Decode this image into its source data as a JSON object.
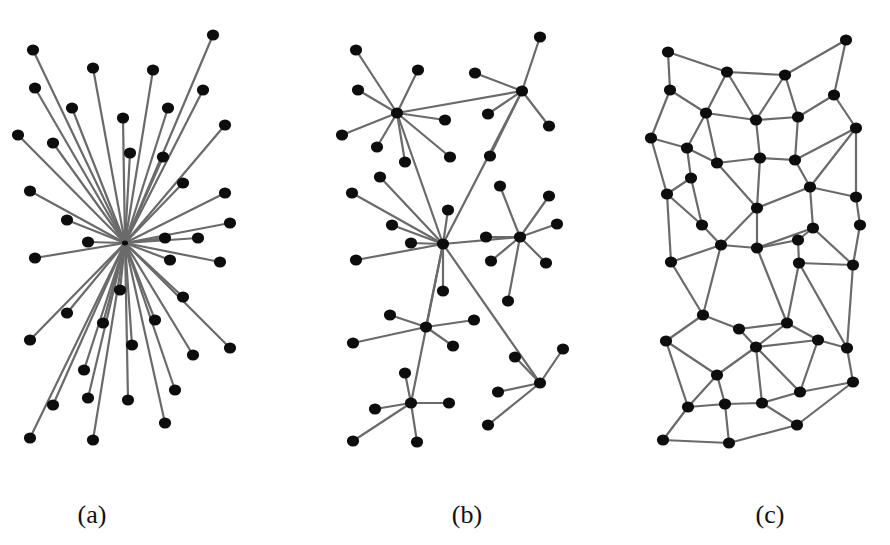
{
  "figure": {
    "panels": [
      {
        "label": "(a)",
        "label_x": 92,
        "type": "centralized",
        "hub": [
          125,
          243
        ],
        "nodes": [
          [
            33,
            50
          ],
          [
            213,
            35
          ],
          [
            93,
            68
          ],
          [
            153,
            70
          ],
          [
            35,
            88
          ],
          [
            203,
            90
          ],
          [
            72,
            108
          ],
          [
            123,
            118
          ],
          [
            168,
            108
          ],
          [
            18,
            135
          ],
          [
            225,
            125
          ],
          [
            53,
            143
          ],
          [
            130,
            153
          ],
          [
            163,
            157
          ],
          [
            183,
            183
          ],
          [
            30,
            191
          ],
          [
            225,
            193
          ],
          [
            67,
            220
          ],
          [
            230,
            223
          ],
          [
            88,
            242
          ],
          [
            165,
            238
          ],
          [
            198,
            238
          ],
          [
            35,
            258
          ],
          [
            170,
            260
          ],
          [
            220,
            262
          ],
          [
            120,
            290
          ],
          [
            183,
            297
          ],
          [
            67,
            313
          ],
          [
            103,
            323
          ],
          [
            155,
            320
          ],
          [
            230,
            348
          ],
          [
            193,
            355
          ],
          [
            30,
            340
          ],
          [
            132,
            345
          ],
          [
            84,
            370
          ],
          [
            175,
            390
          ],
          [
            53,
            405
          ],
          [
            88,
            398
          ],
          [
            128,
            400
          ],
          [
            165,
            423
          ],
          [
            30,
            438
          ],
          [
            93,
            440
          ]
        ]
      },
      {
        "label": "(b)",
        "label_x": 467,
        "type": "decentralized",
        "nodes": [
          [
            443,
            244
          ],
          [
            397,
            113
          ],
          [
            522,
            91
          ],
          [
            520,
            237
          ],
          [
            540,
            383
          ],
          [
            411,
            403
          ],
          [
            426,
            327
          ],
          [
            356,
            50
          ],
          [
            418,
            70
          ],
          [
            358,
            90
          ],
          [
            475,
            73
          ],
          [
            540,
            37
          ],
          [
            342,
            135
          ],
          [
            377,
            147
          ],
          [
            445,
            120
          ],
          [
            450,
            157
          ],
          [
            405,
            162
          ],
          [
            490,
            156
          ],
          [
            549,
            126
          ],
          [
            488,
            114
          ],
          [
            380,
            177
          ],
          [
            352,
            193
          ],
          [
            448,
            210
          ],
          [
            392,
            225
          ],
          [
            411,
            243
          ],
          [
            356,
            260
          ],
          [
            443,
            291
          ],
          [
            500,
            186
          ],
          [
            549,
            196
          ],
          [
            557,
            224
          ],
          [
            486,
            237
          ],
          [
            491,
            261
          ],
          [
            546,
            263
          ],
          [
            508,
            301
          ],
          [
            390,
            315
          ],
          [
            474,
            320
          ],
          [
            353,
            343
          ],
          [
            453,
            346
          ],
          [
            515,
            357
          ],
          [
            563,
            349
          ],
          [
            498,
            392
          ],
          [
            488,
            425
          ],
          [
            405,
            373
          ],
          [
            449,
            403
          ],
          [
            375,
            409
          ],
          [
            353,
            441
          ],
          [
            417,
            442
          ]
        ],
        "edges": [
          [
            0,
            1
          ],
          [
            0,
            2
          ],
          [
            0,
            3
          ],
          [
            0,
            4
          ],
          [
            0,
            5
          ],
          [
            0,
            6
          ],
          [
            1,
            2
          ],
          [
            1,
            7
          ],
          [
            1,
            8
          ],
          [
            1,
            9
          ],
          [
            1,
            12
          ],
          [
            1,
            13
          ],
          [
            1,
            14
          ],
          [
            1,
            15
          ],
          [
            1,
            16
          ],
          [
            2,
            10
          ],
          [
            2,
            11
          ],
          [
            2,
            18
          ],
          [
            2,
            17
          ],
          [
            2,
            19
          ],
          [
            0,
            20
          ],
          [
            0,
            21
          ],
          [
            0,
            22
          ],
          [
            0,
            23
          ],
          [
            0,
            24
          ],
          [
            0,
            25
          ],
          [
            0,
            26
          ],
          [
            3,
            27
          ],
          [
            3,
            28
          ],
          [
            3,
            29
          ],
          [
            3,
            30
          ],
          [
            3,
            31
          ],
          [
            3,
            32
          ],
          [
            3,
            33
          ],
          [
            6,
            34
          ],
          [
            6,
            35
          ],
          [
            6,
            36
          ],
          [
            6,
            37
          ],
          [
            4,
            38
          ],
          [
            4,
            39
          ],
          [
            4,
            40
          ],
          [
            4,
            41
          ],
          [
            5,
            42
          ],
          [
            5,
            43
          ],
          [
            5,
            44
          ],
          [
            5,
            45
          ],
          [
            5,
            46
          ]
        ]
      },
      {
        "label": "(c)",
        "label_x": 770,
        "type": "distributed",
        "nodes": [
          [
            668,
            52
          ],
          [
            727,
            72
          ],
          [
            785,
            75
          ],
          [
            846,
            40
          ],
          [
            670,
            90
          ],
          [
            706,
            113
          ],
          [
            756,
            120
          ],
          [
            798,
            117
          ],
          [
            834,
            95
          ],
          [
            651,
            138
          ],
          [
            687,
            148
          ],
          [
            717,
            163
          ],
          [
            760,
            158
          ],
          [
            795,
            160
          ],
          [
            856,
            128
          ],
          [
            691,
            178
          ],
          [
            667,
            194
          ],
          [
            810,
            187
          ],
          [
            757,
            208
          ],
          [
            856,
            197
          ],
          [
            702,
            225
          ],
          [
            813,
            228
          ],
          [
            757,
            248
          ],
          [
            798,
            240
          ],
          [
            860,
            225
          ],
          [
            671,
            262
          ],
          [
            721,
            245
          ],
          [
            799,
            263
          ],
          [
            853,
            265
          ],
          [
            703,
            315
          ],
          [
            739,
            329
          ],
          [
            787,
            323
          ],
          [
            847,
            348
          ],
          [
            666,
            341
          ],
          [
            756,
            347
          ],
          [
            818,
            340
          ],
          [
            853,
            382
          ],
          [
            717,
            375
          ],
          [
            800,
            392
          ],
          [
            688,
            407
          ],
          [
            725,
            404
          ],
          [
            762,
            403
          ],
          [
            663,
            440
          ],
          [
            729,
            443
          ],
          [
            797,
            425
          ]
        ],
        "edges": [
          [
            0,
            1
          ],
          [
            1,
            2
          ],
          [
            2,
            3
          ],
          [
            0,
            4
          ],
          [
            3,
            8
          ],
          [
            1,
            5
          ],
          [
            1,
            6
          ],
          [
            2,
            6
          ],
          [
            2,
            7
          ],
          [
            4,
            5
          ],
          [
            7,
            8
          ],
          [
            8,
            14
          ],
          [
            5,
            6
          ],
          [
            6,
            7
          ],
          [
            4,
            9
          ],
          [
            9,
            10
          ],
          [
            10,
            11
          ],
          [
            5,
            10
          ],
          [
            5,
            11
          ],
          [
            6,
            12
          ],
          [
            7,
            13
          ],
          [
            11,
            12
          ],
          [
            12,
            13
          ],
          [
            13,
            14
          ],
          [
            9,
            16
          ],
          [
            10,
            15
          ],
          [
            15,
            16
          ],
          [
            11,
            18
          ],
          [
            12,
            18
          ],
          [
            13,
            17
          ],
          [
            14,
            17
          ],
          [
            14,
            19
          ],
          [
            17,
            18
          ],
          [
            17,
            21
          ],
          [
            17,
            19
          ],
          [
            19,
            24
          ],
          [
            16,
            20
          ],
          [
            15,
            20
          ],
          [
            16,
            25
          ],
          [
            18,
            22
          ],
          [
            18,
            26
          ],
          [
            20,
            26
          ],
          [
            21,
            22
          ],
          [
            21,
            23
          ],
          [
            21,
            28
          ],
          [
            24,
            28
          ],
          [
            22,
            23
          ],
          [
            23,
            27
          ],
          [
            22,
            26
          ],
          [
            26,
            25
          ],
          [
            25,
            29
          ],
          [
            27,
            28
          ],
          [
            22,
            31
          ],
          [
            26,
            29
          ],
          [
            27,
            31
          ],
          [
            27,
            32
          ],
          [
            28,
            32
          ],
          [
            29,
            30
          ],
          [
            30,
            31
          ],
          [
            29,
            33
          ],
          [
            30,
            34
          ],
          [
            31,
            34
          ],
          [
            31,
            35
          ],
          [
            32,
            35
          ],
          [
            32,
            36
          ],
          [
            34,
            35
          ],
          [
            33,
            37
          ],
          [
            33,
            39
          ],
          [
            34,
            37
          ],
          [
            34,
            38
          ],
          [
            35,
            38
          ],
          [
            36,
            38
          ],
          [
            36,
            44
          ],
          [
            37,
            39
          ],
          [
            37,
            40
          ],
          [
            39,
            40
          ],
          [
            40,
            41
          ],
          [
            34,
            41
          ],
          [
            41,
            38
          ],
          [
            41,
            44
          ],
          [
            39,
            42
          ],
          [
            42,
            43
          ],
          [
            40,
            43
          ],
          [
            43,
            44
          ]
        ]
      }
    ]
  }
}
